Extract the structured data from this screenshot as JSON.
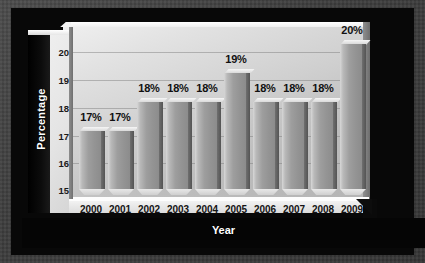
{
  "chart_data": {
    "type": "bar",
    "title": "",
    "xlabel": "Year",
    "ylabel": "Percentage",
    "categories": [
      "2000",
      "2001",
      "2002",
      "2003",
      "2004",
      "2005",
      "2006",
      "2007",
      "2008",
      "2009"
    ],
    "values": [
      17,
      17,
      18,
      18,
      18,
      19,
      18,
      18,
      18,
      20
    ],
    "data_labels": [
      "17%",
      "17%",
      "18%",
      "18%",
      "18%",
      "19%",
      "18%",
      "18%",
      "18%",
      "20%"
    ],
    "ylim": [
      15,
      20
    ],
    "yticks": [
      "20",
      "19",
      "18",
      "17",
      "16",
      "15"
    ],
    "ytick_values": [
      20,
      19,
      18,
      17,
      16,
      15
    ],
    "grid": true,
    "legend": "none",
    "style": "3d-bar",
    "colors": {
      "bar_face": "#9e9e9e",
      "bar_side": "#5f5f5f",
      "bar_top": "#e8e8e8",
      "plot_background": "#d2d2d2",
      "frame": "#080808",
      "axis_band": "#000000",
      "axis_text": "#ffffff",
      "label_text": "#111111",
      "backdrop": "#3c3c3c"
    }
  }
}
